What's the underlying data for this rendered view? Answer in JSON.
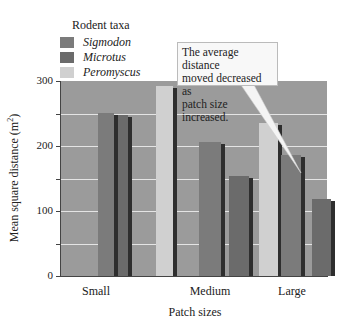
{
  "chart_data": {
    "type": "bar",
    "title": "",
    "legend_title": "Rodent taxa",
    "categories": [
      "Small",
      "Medium",
      "Large"
    ],
    "series": [
      {
        "name": "Sigmodon",
        "color": "#7b7b7b",
        "values": [
          251,
          206,
          186
        ]
      },
      {
        "name": "Microtus",
        "color": "#6b6b6b",
        "values": [
          248,
          154,
          118
        ]
      },
      {
        "name": "Peromyscus",
        "color": "#d0d0d0",
        "values": [
          292,
          235,
          145
        ]
      }
    ],
    "xlabel": "Patch sizes",
    "ylabel": "Mean square distance (m",
    "ylabel_sup": "2",
    "ylabel_end": ")",
    "ylim": [
      0,
      300
    ],
    "yticks": [
      "0",
      "100",
      "200",
      "300"
    ],
    "grid": true,
    "legend_position": "top-left",
    "annotation": {
      "lines": [
        "The average distance",
        "moved decreased as",
        "patch size increased."
      ],
      "points_to": "Large"
    },
    "background_color": "#9b9b9b"
  }
}
